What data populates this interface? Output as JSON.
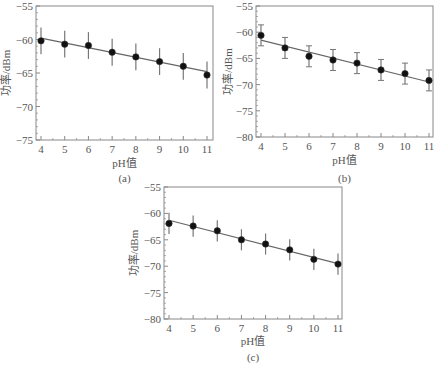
{
  "chart_data": [
    {
      "type": "scatter",
      "panel": "(a)",
      "caption": "(a)",
      "xlabel": "pH值",
      "ylabel": "功率/dBm",
      "x": [
        4,
        5,
        6,
        7,
        8,
        9,
        10,
        11
      ],
      "values": [
        -60.2,
        -60.7,
        -60.9,
        -61.9,
        -62.6,
        -63.3,
        -64.0,
        -65.3
      ],
      "error": [
        2,
        2,
        2,
        2,
        2,
        2,
        2,
        2
      ],
      "error_caps": false,
      "fit_line": {
        "x0": 4,
        "y0": -59.8,
        "x1": 11,
        "y1": -64.8
      },
      "xlim": [
        4,
        11
      ],
      "ylim": [
        -75,
        -55
      ],
      "xticks": [
        "4",
        "5",
        "6",
        "7",
        "8",
        "9",
        "10",
        "11"
      ],
      "yticks": [
        "-55",
        "-60",
        "-65",
        "-70",
        "-75"
      ],
      "grid": false
    },
    {
      "type": "scatter",
      "panel": "(b)",
      "caption": "(b)",
      "xlabel": "pH值",
      "ylabel": "功率/dBm",
      "x": [
        4,
        5,
        6,
        7,
        8,
        9,
        10,
        11
      ],
      "values": [
        -60.6,
        -63.0,
        -64.6,
        -65.3,
        -65.9,
        -67.2,
        -67.9,
        -69.2
      ],
      "error": [
        2,
        2,
        2,
        2,
        2,
        2,
        2,
        2
      ],
      "error_caps": true,
      "fit_line": {
        "x0": 4,
        "y0": -61.5,
        "x1": 11,
        "y1": -69.5
      },
      "xlim": [
        4,
        11
      ],
      "ylim": [
        -80,
        -55
      ],
      "xticks": [
        "4",
        "5",
        "6",
        "7",
        "8",
        "9",
        "10",
        "11"
      ],
      "yticks": [
        "-55",
        "-60",
        "-65",
        "-70",
        "-75",
        "-80"
      ],
      "grid": false
    },
    {
      "type": "scatter",
      "panel": "(c)",
      "caption": "(c)",
      "xlabel": "pH值",
      "ylabel": "功率/dBm",
      "x": [
        4,
        5,
        6,
        7,
        8,
        9,
        10,
        11
      ],
      "values": [
        -61.9,
        -62.4,
        -63.3,
        -65.0,
        -65.8,
        -66.9,
        -68.7,
        -69.6
      ],
      "error": [
        2,
        2,
        2,
        2,
        2,
        2,
        2,
        2
      ],
      "error_caps": false,
      "fit_line": {
        "x0": 4,
        "y0": -61.3,
        "x1": 11,
        "y1": -69.5
      },
      "xlim": [
        4,
        11
      ],
      "ylim": [
        -80,
        -55
      ],
      "xticks": [
        "4",
        "5",
        "6",
        "7",
        "8",
        "9",
        "10",
        "11"
      ],
      "yticks": [
        "-55",
        "-60",
        "-65",
        "-70",
        "-75",
        "-80"
      ],
      "grid": false
    }
  ],
  "colors": {
    "axis": "#888888",
    "marker": "#111111",
    "line": "#666666",
    "errorbar": "#777777",
    "text": "#555555"
  }
}
